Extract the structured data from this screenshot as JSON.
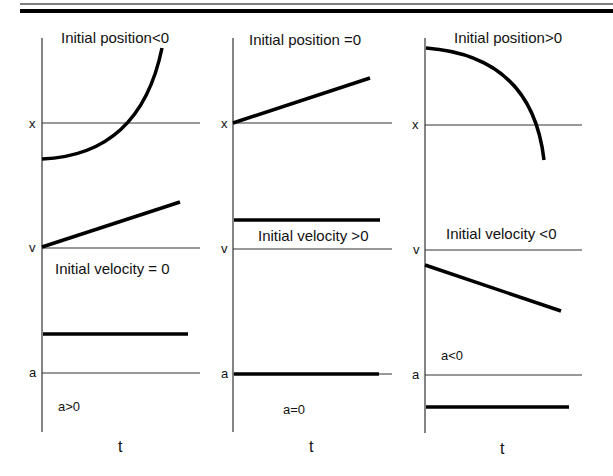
{
  "header": {
    "rule_color": "#000000"
  },
  "columns": [
    {
      "position_title": "Initial position<0",
      "velocity_title": "Initial velocity = 0",
      "accel_title": "a>0",
      "axis_x": "x",
      "axis_v": "v",
      "axis_a": "a",
      "axis_t": "t"
    },
    {
      "position_title": "Initial position =0",
      "velocity_title": "Initial velocity >0",
      "accel_title": "a=0",
      "axis_x": "x",
      "axis_v": "v",
      "axis_a": "a",
      "axis_t": "t"
    },
    {
      "position_title": "Initial position>0",
      "velocity_title": "Initial velocity <0",
      "accel_title": "a<0",
      "axis_x": "x",
      "axis_v": "v",
      "axis_a": "a",
      "axis_t": "t"
    }
  ],
  "colors": {
    "stroke": "#000000",
    "axis": "#333333",
    "background": "#ffffff"
  }
}
